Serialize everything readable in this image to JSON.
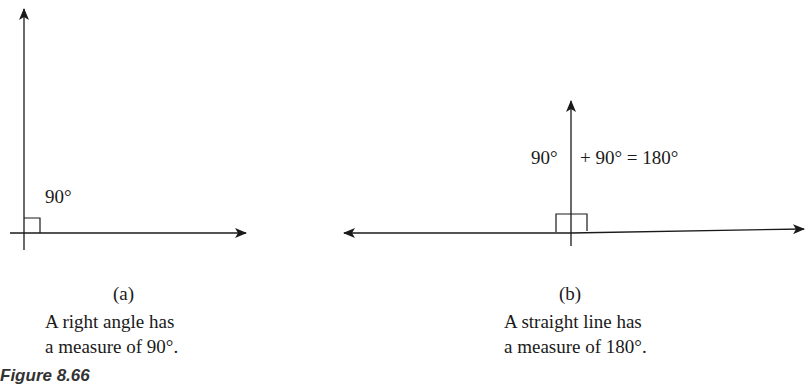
{
  "figure": {
    "number_label": "Figure 8.66",
    "line_color": "#1a1a1a",
    "panels": [
      {
        "id": "a",
        "sub_label": "(a)",
        "angle_label": "90°",
        "caption_line1": "A right angle has",
        "caption_line2": "a measure of 90°."
      },
      {
        "id": "b",
        "sub_label": "(b)",
        "angle_label_left": "90°",
        "angle_label_right": "+ 90° = 180°",
        "caption_line1": "A straight line has",
        "caption_line2": "a measure of 180°."
      }
    ]
  }
}
